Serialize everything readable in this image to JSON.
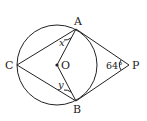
{
  "diagram": {
    "points": {
      "A": {
        "label": "A",
        "x": 76,
        "y": 29
      },
      "B": {
        "label": "B",
        "x": 76,
        "y": 101
      },
      "C": {
        "label": "C",
        "x": 17,
        "y": 65
      },
      "O": {
        "label": "O",
        "x": 57,
        "y": 65
      },
      "P": {
        "label": "P",
        "x": 129,
        "y": 65
      }
    },
    "circle": {
      "center": "O",
      "radius": 40
    },
    "angles": {
      "P": {
        "label": "64°"
      },
      "x": {
        "label": "x"
      },
      "y": {
        "label": "y"
      }
    },
    "stroke_color": "#222222"
  }
}
